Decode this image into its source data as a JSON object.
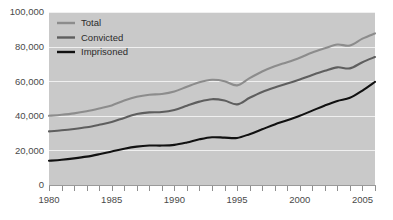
{
  "chart_data": {
    "type": "line",
    "title": "",
    "subtitle": "",
    "xlabel": "",
    "ylabel": "",
    "grid": true,
    "gridlines_axis": "y",
    "legend_position": "top-left",
    "xlim": [
      1980,
      2006
    ],
    "ylim": [
      0,
      100000
    ],
    "y_ticks": [
      0,
      20000,
      40000,
      60000,
      80000,
      100000
    ],
    "y_tick_labels": [
      "0",
      "20,000",
      "40,000",
      "60,000",
      "80,000",
      "100,000"
    ],
    "x_ticks_major": [
      1980,
      1985,
      1990,
      1995,
      2000,
      2005
    ],
    "x_tick_labels": [
      "1980",
      "1985",
      "1990",
      "1995",
      "2000",
      "2005"
    ],
    "x_ticks_minor_step": 1,
    "x": [
      1980,
      1981,
      1982,
      1983,
      1984,
      1985,
      1986,
      1987,
      1988,
      1989,
      1990,
      1991,
      1992,
      1993,
      1994,
      1995,
      1996,
      1997,
      1998,
      1999,
      2000,
      2001,
      2002,
      2003,
      2004,
      2005,
      2006
    ],
    "series": [
      {
        "name": "Total",
        "color": "#8c8c8c",
        "values": [
          40000,
          40600,
          41400,
          42600,
          44200,
          46000,
          48800,
          51000,
          52200,
          52600,
          54000,
          56800,
          59400,
          60800,
          60000,
          57600,
          61800,
          65600,
          68600,
          71000,
          73600,
          76600,
          79000,
          81200,
          80600,
          84600,
          87600
        ]
      },
      {
        "name": "Convicted",
        "color": "#5e5e5e",
        "values": [
          31000,
          31600,
          32400,
          33400,
          34800,
          36400,
          38800,
          41000,
          42000,
          42200,
          43400,
          45800,
          48200,
          49600,
          48800,
          46600,
          50400,
          53800,
          56400,
          58600,
          61000,
          63600,
          66000,
          68000,
          67400,
          71000,
          74000
        ]
      },
      {
        "name": "Imprisoned",
        "color": "#111111",
        "values": [
          14000,
          14600,
          15400,
          16400,
          17800,
          19400,
          21000,
          22200,
          22800,
          22800,
          23200,
          24600,
          26400,
          27600,
          27400,
          27200,
          29400,
          32200,
          35000,
          37400,
          40000,
          43000,
          46000,
          48600,
          50400,
          54600,
          59600
        ]
      }
    ]
  },
  "legend": {
    "items": [
      {
        "label": "Total",
        "color": "#8c8c8c"
      },
      {
        "label": "Convicted",
        "color": "#5e5e5e"
      },
      {
        "label": "Imprisoned",
        "color": "#111111"
      }
    ]
  },
  "colors": {
    "plot_background": "#c9c9c9",
    "page_background": "#ffffff",
    "gridline": "#f0f0f0",
    "axis": "#9a9a9a",
    "tick_label": "#4a4a4a"
  }
}
